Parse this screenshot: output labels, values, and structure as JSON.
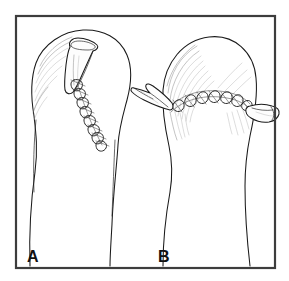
{
  "figure": {
    "kind": "surgical-line-art-illustration",
    "background_color": "#ffffff",
    "ink_color": "#1a1a1a",
    "frame": {
      "present": true,
      "color": "#3d3d3d",
      "x": 16,
      "y": 16,
      "width": 259,
      "height": 252
    }
  },
  "panels": [
    {
      "id": "A",
      "label": "A",
      "label_x": 27,
      "label_y": 262,
      "subject": "digit-with-longitudinal-suture-line",
      "drain": {
        "name": "penrose-drain",
        "count": 1,
        "exit": "dorsal-tip",
        "orientation": "oblique-upper-right"
      },
      "suture_line": {
        "orientation": "oblique-longitudinal",
        "stitch_count": 8,
        "type": "interrupted"
      }
    },
    {
      "id": "B",
      "label": "B",
      "label_x": 158,
      "label_y": 262,
      "subject": "digit-with-transverse-suture-line",
      "drain": {
        "name": "penrose-drain",
        "count": 2,
        "exit": "both-lateral-sides",
        "orientation": "transverse"
      },
      "suture_line": {
        "orientation": "transverse-arched",
        "stitch_count": 8,
        "type": "interrupted"
      }
    }
  ]
}
